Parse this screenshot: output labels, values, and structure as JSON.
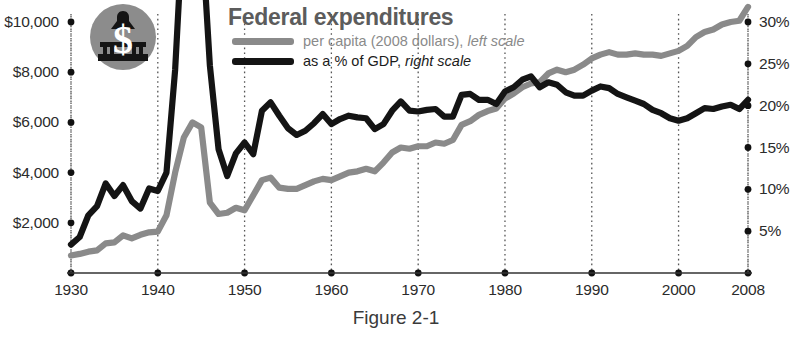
{
  "title": "Federal expenditures",
  "caption": "Figure 2-1",
  "logo": {
    "name": "capitol-dollar-logo",
    "circle_color": "#8c8c8c",
    "symbol": "$"
  },
  "legend": [
    {
      "key": "per_capita",
      "swatch_color": "#8a8a8a",
      "label": "per capita (2008 dollars), ",
      "emphasis": "left scale"
    },
    {
      "key": "gdp_percent",
      "swatch_color": "#141414",
      "label": "as a % of GDP, ",
      "emphasis": "right scale"
    }
  ],
  "axes": {
    "left_ticks": [
      "$2,000",
      "$4,000",
      "$6,000",
      "$8,000",
      "$10,000"
    ],
    "right_ticks": [
      "5%",
      "10%",
      "15%",
      "20%",
      "25%",
      "30%"
    ],
    "x_ticks": [
      "1930",
      "1940",
      "1950",
      "1960",
      "1970",
      "1980",
      "1990",
      "2000",
      "2008"
    ]
  },
  "chart_data": {
    "type": "line",
    "title": "Federal expenditures",
    "subtitle": "",
    "xlabel": "",
    "ylabel": "per capita (2008 dollars)",
    "y2label": "as a % of GDP",
    "xlim": [
      1930,
      2008
    ],
    "ylim": [
      0,
      10000
    ],
    "y2lim": [
      0,
      30
    ],
    "grid": false,
    "legend_position": "top-center",
    "x_tick_values": [
      1930,
      1940,
      1950,
      1960,
      1970,
      1980,
      1990,
      2000,
      2008
    ],
    "y_tick_values": [
      2000,
      4000,
      6000,
      8000,
      10000
    ],
    "y2_tick_values": [
      5,
      10,
      15,
      20,
      25,
      30
    ],
    "series": [
      {
        "name": "per capita (2008 dollars), left scale",
        "axis": "left",
        "color": "#8a8a8a",
        "x": [
          1930,
          1931,
          1932,
          1933,
          1934,
          1935,
          1936,
          1937,
          1938,
          1939,
          1940,
          1941,
          1942,
          1943,
          1944,
          1945,
          1946,
          1947,
          1948,
          1949,
          1950,
          1951,
          1952,
          1953,
          1954,
          1955,
          1956,
          1957,
          1958,
          1959,
          1960,
          1961,
          1962,
          1963,
          1964,
          1965,
          1966,
          1967,
          1968,
          1969,
          1970,
          1971,
          1972,
          1973,
          1974,
          1975,
          1976,
          1977,
          1978,
          1979,
          1980,
          1981,
          1982,
          1983,
          1984,
          1985,
          1986,
          1987,
          1988,
          1989,
          1990,
          1991,
          1992,
          1993,
          1994,
          1995,
          1996,
          1997,
          1998,
          1999,
          2000,
          2001,
          2002,
          2003,
          2004,
          2005,
          2006,
          2007,
          2008
        ],
        "values": [
          700,
          760,
          850,
          900,
          1180,
          1220,
          1500,
          1380,
          1520,
          1620,
          1650,
          2300,
          4000,
          5400,
          6000,
          5800,
          2800,
          2350,
          2400,
          2600,
          2500,
          3100,
          3700,
          3800,
          3400,
          3350,
          3350,
          3500,
          3650,
          3750,
          3700,
          3850,
          4000,
          4050,
          4150,
          4050,
          4400,
          4800,
          5000,
          4950,
          5050,
          5050,
          5200,
          5150,
          5300,
          5900,
          6050,
          6300,
          6450,
          6550,
          6950,
          7150,
          7400,
          7550,
          7600,
          7950,
          8100,
          8000,
          8100,
          8300,
          8550,
          8700,
          8800,
          8700,
          8700,
          8750,
          8700,
          8700,
          8650,
          8750,
          8850,
          9050,
          9400,
          9600,
          9700,
          9900,
          10000,
          10050,
          10600
        ],
        "notable": {
          "1944_peak": 6000,
          "1930_start": 700,
          "2008_end": 9600
        }
      },
      {
        "name": "as a % of GDP, right scale",
        "axis": "right",
        "color": "#141414",
        "x": [
          1930,
          1931,
          1932,
          1933,
          1934,
          1935,
          1936,
          1937,
          1938,
          1939,
          1940,
          1941,
          1942,
          1943,
          1944,
          1945,
          1946,
          1947,
          1948,
          1949,
          1950,
          1951,
          1952,
          1953,
          1954,
          1955,
          1956,
          1957,
          1958,
          1959,
          1960,
          1961,
          1962,
          1963,
          1964,
          1965,
          1966,
          1967,
          1968,
          1969,
          1970,
          1971,
          1972,
          1973,
          1974,
          1975,
          1976,
          1977,
          1978,
          1979,
          1980,
          1981,
          1982,
          1983,
          1984,
          1985,
          1986,
          1987,
          1988,
          1989,
          1990,
          1991,
          1992,
          1993,
          1994,
          1995,
          1996,
          1997,
          1998,
          1999,
          2000,
          2001,
          2002,
          2003,
          2004,
          2005,
          2006,
          2007,
          2008
        ],
        "values": [
          3.4,
          4.3,
          6.9,
          8.0,
          10.7,
          9.2,
          10.5,
          8.6,
          7.7,
          10.1,
          9.8,
          12.0,
          24.3,
          43.6,
          43.7,
          41.9,
          24.8,
          14.8,
          11.6,
          14.3,
          15.6,
          14.2,
          19.4,
          20.4,
          18.8,
          17.3,
          16.5,
          17.0,
          17.9,
          19.0,
          17.8,
          18.4,
          18.8,
          18.6,
          18.5,
          17.2,
          17.8,
          19.4,
          20.5,
          19.4,
          19.3,
          19.5,
          19.6,
          18.7,
          18.7,
          21.3,
          21.4,
          20.7,
          20.7,
          20.2,
          21.7,
          22.2,
          23.1,
          23.5,
          22.2,
          22.8,
          22.5,
          21.6,
          21.2,
          21.2,
          21.8,
          22.3,
          22.1,
          21.4,
          21.0,
          20.6,
          20.2,
          19.5,
          19.1,
          18.5,
          18.2,
          18.5,
          19.1,
          19.7,
          19.6,
          19.9,
          20.1,
          19.6,
          20.7
        ],
        "notable": {
          "1944_peak": 43.7,
          "1930_start": 3.4,
          "2000_low": 18.2,
          "2008_end": 20.7
        }
      }
    ]
  }
}
